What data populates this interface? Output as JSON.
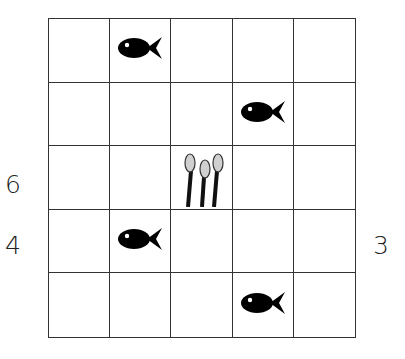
{
  "grid": {
    "rows": 5,
    "cols": 5,
    "cells": [
      [
        "",
        "fish",
        "",
        "",
        ""
      ],
      [
        "",
        "",
        "",
        "fish",
        ""
      ],
      [
        "",
        "",
        "reeds",
        "",
        ""
      ],
      [
        "",
        "fish",
        "",
        "",
        ""
      ],
      [
        "",
        "",
        "",
        "fish",
        ""
      ]
    ]
  },
  "labels": {
    "left_row3": "6",
    "left_row4": "4",
    "right_row4": "3"
  },
  "colors": {
    "line": "#333333",
    "fish": "#000000",
    "reed_head": "#d0d0d0"
  }
}
